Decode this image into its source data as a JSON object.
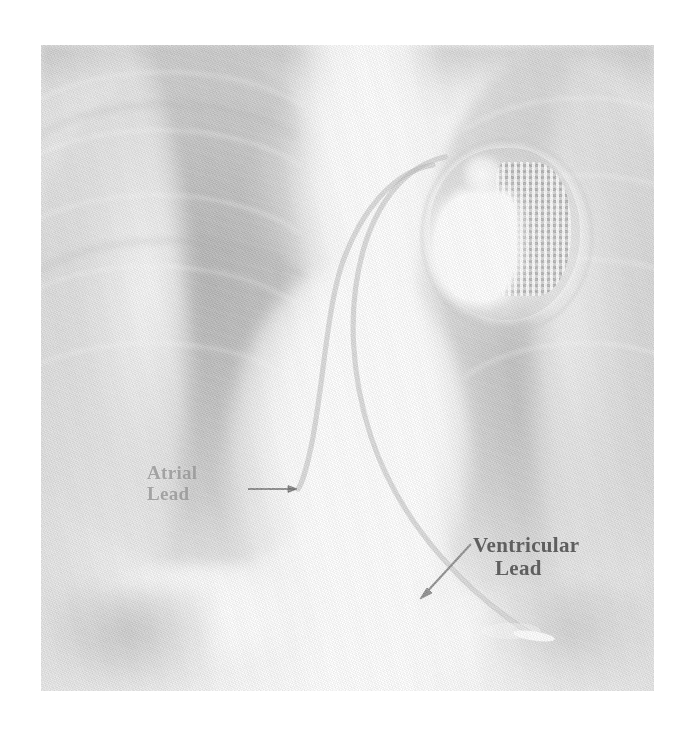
{
  "image": {
    "kind": "chest-radiograph",
    "view": "posteroanterior",
    "plate": {
      "left": 41,
      "top": 45,
      "width": 613,
      "height": 646
    },
    "background_color": "#ffffff",
    "film_base_color": "#e9e9e9"
  },
  "annotations": [
    {
      "id": "atrial-lead",
      "text": "Atrial\nLead",
      "line1": "Atrial",
      "line2": "Lead",
      "color": "#606060",
      "opacity": "0.52",
      "font_size_px": 19,
      "arrow": {
        "direction": "right",
        "from": [
          248,
          489
        ],
        "to": [
          298,
          489
        ],
        "color": "#6a6a6a"
      }
    },
    {
      "id": "ventricular-lead",
      "text": "Ventricular\nLead",
      "line1": "Ventricular",
      "line2": "Lead",
      "color": "#5f5f5f",
      "opacity": "1",
      "font_size_px": 21,
      "arrow": {
        "direction": "down-left",
        "from": [
          470,
          544
        ],
        "to": [
          420,
          596
        ],
        "color": "#8a8a8a"
      }
    }
  ],
  "devices": {
    "pulse_generator": {
      "name": "pacemaker-generator",
      "location": "left-infraclavicular",
      "center": [
        490,
        227
      ],
      "diameter_px": 150,
      "battery_color": "#ffffff",
      "circuitry_pattern": "grid"
    },
    "leads": [
      {
        "name": "atrial-lead-wire",
        "tip": [
          298,
          489
        ],
        "course": "generator to right atrium"
      },
      {
        "name": "ventricular-lead-wire",
        "tip": [
          534,
          636
        ],
        "course": "generator to right ventricular apex"
      }
    ]
  },
  "anatomy": [
    {
      "name": "right-lung-field",
      "side": "image-left"
    },
    {
      "name": "left-lung-field",
      "side": "image-right"
    },
    {
      "name": "mediastinum",
      "side": "center"
    },
    {
      "name": "cardiac-silhouette",
      "side": "center-lower"
    },
    {
      "name": "right-hemidiaphragm",
      "side": "image-left-lower"
    },
    {
      "name": "left-hemidiaphragm",
      "side": "image-right-lower"
    }
  ]
}
